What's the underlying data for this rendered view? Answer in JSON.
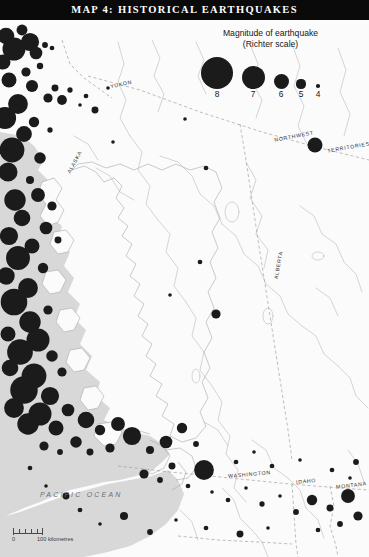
{
  "title": {
    "text": "MAP 4: HISTORICAL EARTHQUAKES"
  },
  "legend": {
    "heading_line1": "Magnitude of earthquake",
    "heading_line2": "(Richter scale)",
    "symbols": [
      {
        "label": "8",
        "radius": 16.0,
        "cx": 34,
        "cy": 20
      },
      {
        "label": "7",
        "radius": 11.5,
        "cx": 70,
        "cy": 24
      },
      {
        "label": "6",
        "radius": 7.5,
        "cx": 98,
        "cy": 28
      },
      {
        "label": "5",
        "radius": 4.6,
        "cx": 118,
        "cy": 31
      },
      {
        "label": "4",
        "radius": 1.8,
        "cx": 135,
        "cy": 33
      }
    ]
  },
  "labels": {
    "yukon": "YUKON",
    "alaska": "ALASKA",
    "northwest": "NORTHWEST",
    "territories": "TERRITORIES",
    "alberta": "ALBERTA",
    "washington": "WASHINGTON",
    "idaho": "IDAHO",
    "montana": "MONTANA",
    "ocean": "PACIFIC OCEAN"
  },
  "scale": {
    "zero": "0",
    "distance": "100 kilometres"
  },
  "colors": {
    "title_bg": "#0a0a0a",
    "title_fg": "#ffffff",
    "land": "#fbfbfb",
    "ocean": "#d8d8d8",
    "quake_fill": "#1b1b1b",
    "border_line": "#9a9a9a",
    "river_line": "#b4b4b4",
    "coast_line": "#a8a8a8",
    "label_fg": "#2b2b2b"
  },
  "chart_data": {
    "type": "scatter",
    "title": "MAP 4: HISTORICAL EARTHQUAKES",
    "legend_title": "Magnitude of earthquake (Richter scale)",
    "magnitude_scale": [
      8,
      7,
      6,
      5,
      4
    ],
    "quakes": [
      {
        "x": 6,
        "y": 36,
        "m": 6.2
      },
      {
        "x": 22,
        "y": 30,
        "m": 5.3
      },
      {
        "x": 30,
        "y": 42,
        "m": 6.4
      },
      {
        "x": 14,
        "y": 49,
        "m": 7.0
      },
      {
        "x": 36,
        "y": 53,
        "m": 5.6
      },
      {
        "x": 3,
        "y": 62,
        "m": 6.0
      },
      {
        "x": 45,
        "y": 45,
        "m": 4.4
      },
      {
        "x": 52,
        "y": 48,
        "m": 4.2
      },
      {
        "x": 40,
        "y": 66,
        "m": 4.5
      },
      {
        "x": 26,
        "y": 72,
        "m": 5.0
      },
      {
        "x": 9,
        "y": 80,
        "m": 6.0
      },
      {
        "x": 32,
        "y": 86,
        "m": 5.5
      },
      {
        "x": 55,
        "y": 88,
        "m": 4.6
      },
      {
        "x": 70,
        "y": 90,
        "m": 4.3
      },
      {
        "x": 48,
        "y": 98,
        "m": 5.0
      },
      {
        "x": 18,
        "y": 104,
        "m": 6.6
      },
      {
        "x": 62,
        "y": 100,
        "m": 5.1
      },
      {
        "x": 86,
        "y": 96,
        "m": 4.2
      },
      {
        "x": 80,
        "y": 105,
        "m": 4.0
      },
      {
        "x": 95,
        "y": 110,
        "m": 4.6
      },
      {
        "x": 5,
        "y": 118,
        "m": 6.9
      },
      {
        "x": 34,
        "y": 122,
        "m": 5.2
      },
      {
        "x": 24,
        "y": 134,
        "m": 6.1
      },
      {
        "x": 50,
        "y": 130,
        "m": 4.3
      },
      {
        "x": 12,
        "y": 150,
        "m": 7.2
      },
      {
        "x": 40,
        "y": 158,
        "m": 5.4
      },
      {
        "x": 8,
        "y": 172,
        "m": 6.5
      },
      {
        "x": 30,
        "y": 180,
        "m": 4.8
      },
      {
        "x": 108,
        "y": 88,
        "m": 3.8
      },
      {
        "x": 113,
        "y": 142,
        "m": 3.9
      },
      {
        "x": 185,
        "y": 119,
        "m": 4.0
      },
      {
        "x": 315,
        "y": 145,
        "m": 6.0
      },
      {
        "x": 206,
        "y": 168,
        "m": 4.2
      },
      {
        "x": 200,
        "y": 262,
        "m": 4.2
      },
      {
        "x": 170,
        "y": 295,
        "m": 4.0
      },
      {
        "x": 216,
        "y": 314,
        "m": 5.0
      },
      {
        "x": 15,
        "y": 200,
        "m": 6.8
      },
      {
        "x": 38,
        "y": 195,
        "m": 5.8
      },
      {
        "x": 52,
        "y": 206,
        "m": 5.0
      },
      {
        "x": 22,
        "y": 218,
        "m": 6.2
      },
      {
        "x": 46,
        "y": 228,
        "m": 5.6
      },
      {
        "x": 9,
        "y": 236,
        "m": 6.4
      },
      {
        "x": 32,
        "y": 246,
        "m": 6.0
      },
      {
        "x": 58,
        "y": 240,
        "m": 4.6
      },
      {
        "x": 18,
        "y": 258,
        "m": 7.1
      },
      {
        "x": 43,
        "y": 268,
        "m": 5.2
      },
      {
        "x": 6,
        "y": 276,
        "m": 6.3
      },
      {
        "x": 28,
        "y": 288,
        "m": 6.6
      },
      {
        "x": 14,
        "y": 302,
        "m": 7.4
      },
      {
        "x": 48,
        "y": 310,
        "m": 5.0
      },
      {
        "x": 30,
        "y": 322,
        "m": 6.8
      },
      {
        "x": 8,
        "y": 334,
        "m": 6.0
      },
      {
        "x": 38,
        "y": 340,
        "m": 7.0
      },
      {
        "x": 20,
        "y": 352,
        "m": 7.3
      },
      {
        "x": 52,
        "y": 356,
        "m": 5.4
      },
      {
        "x": 10,
        "y": 368,
        "m": 6.2
      },
      {
        "x": 34,
        "y": 376,
        "m": 7.2
      },
      {
        "x": 62,
        "y": 372,
        "m": 5.0
      },
      {
        "x": 24,
        "y": 390,
        "m": 7.5
      },
      {
        "x": 50,
        "y": 396,
        "m": 6.4
      },
      {
        "x": 14,
        "y": 408,
        "m": 6.6
      },
      {
        "x": 40,
        "y": 414,
        "m": 7.0
      },
      {
        "x": 68,
        "y": 410,
        "m": 5.6
      },
      {
        "x": 28,
        "y": 424,
        "m": 6.8
      },
      {
        "x": 56,
        "y": 428,
        "m": 6.0
      },
      {
        "x": 86,
        "y": 420,
        "m": 6.2
      },
      {
        "x": 100,
        "y": 430,
        "m": 5.2
      },
      {
        "x": 118,
        "y": 424,
        "m": 5.8
      },
      {
        "x": 132,
        "y": 436,
        "m": 6.4
      },
      {
        "x": 110,
        "y": 448,
        "m": 5.0
      },
      {
        "x": 76,
        "y": 442,
        "m": 5.4
      },
      {
        "x": 90,
        "y": 452,
        "m": 4.6
      },
      {
        "x": 60,
        "y": 452,
        "m": 4.4
      },
      {
        "x": 44,
        "y": 446,
        "m": 5.0
      },
      {
        "x": 150,
        "y": 450,
        "m": 4.8
      },
      {
        "x": 166,
        "y": 442,
        "m": 5.6
      },
      {
        "x": 182,
        "y": 428,
        "m": 5.2
      },
      {
        "x": 196,
        "y": 444,
        "m": 4.4
      },
      {
        "x": 172,
        "y": 466,
        "m": 4.6
      },
      {
        "x": 204,
        "y": 470,
        "m": 6.6
      },
      {
        "x": 188,
        "y": 486,
        "m": 4.2
      },
      {
        "x": 160,
        "y": 480,
        "m": 4.4
      },
      {
        "x": 144,
        "y": 474,
        "m": 5.0
      },
      {
        "x": 212,
        "y": 492,
        "m": 4.0
      },
      {
        "x": 228,
        "y": 500,
        "m": 4.2
      },
      {
        "x": 246,
        "y": 488,
        "m": 4.0
      },
      {
        "x": 262,
        "y": 504,
        "m": 4.3
      },
      {
        "x": 280,
        "y": 496,
        "m": 4.0
      },
      {
        "x": 296,
        "y": 512,
        "m": 4.4
      },
      {
        "x": 312,
        "y": 500,
        "m": 5.2
      },
      {
        "x": 330,
        "y": 508,
        "m": 4.6
      },
      {
        "x": 348,
        "y": 496,
        "m": 5.8
      },
      {
        "x": 358,
        "y": 516,
        "m": 5.0
      },
      {
        "x": 340,
        "y": 524,
        "m": 4.4
      },
      {
        "x": 318,
        "y": 530,
        "m": 4.2
      },
      {
        "x": 268,
        "y": 528,
        "m": 4.0
      },
      {
        "x": 240,
        "y": 534,
        "m": 4.6
      },
      {
        "x": 206,
        "y": 528,
        "m": 4.2
      },
      {
        "x": 176,
        "y": 520,
        "m": 4.0
      },
      {
        "x": 150,
        "y": 532,
        "m": 4.4
      },
      {
        "x": 124,
        "y": 516,
        "m": 4.8
      },
      {
        "x": 100,
        "y": 524,
        "m": 4.0
      },
      {
        "x": 80,
        "y": 510,
        "m": 4.2
      },
      {
        "x": 66,
        "y": 496,
        "m": 4.6
      },
      {
        "x": 46,
        "y": 486,
        "m": 4.0
      },
      {
        "x": 30,
        "y": 468,
        "m": 4.2
      },
      {
        "x": 356,
        "y": 462,
        "m": 4.4
      },
      {
        "x": 350,
        "y": 478,
        "m": 4.0
      },
      {
        "x": 332,
        "y": 470,
        "m": 4.2
      },
      {
        "x": 300,
        "y": 460,
        "m": 4.0
      },
      {
        "x": 272,
        "y": 466,
        "m": 4.2
      },
      {
        "x": 254,
        "y": 452,
        "m": 4.0
      },
      {
        "x": 236,
        "y": 462,
        "m": 4.2
      }
    ],
    "xlabel": "",
    "ylabel": "",
    "grid": false,
    "legend_position": "top-right"
  }
}
